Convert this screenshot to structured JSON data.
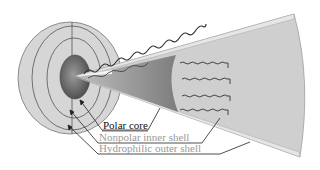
{
  "figure": {
    "type": "micelle-cross-section",
    "labels": {
      "polar_core": "Polar core",
      "nonpolar_inner_shell": "Nonpolar inner shell",
      "hydrophilic_outer_shell": "Hydrophilic outer shell"
    },
    "colors": {
      "background": "#ffffff",
      "sphere_fill": "#d4d4d4",
      "sphere_stroke": "#6f6f6f",
      "core_fill": "#6b6b6b",
      "cone_fill": "#cfcfcf",
      "cone_band": "#e2e2e2",
      "inner_wedge": "#8a8a8a",
      "chain_stroke": "#2e2e2e",
      "label_dark": "#111111",
      "label_light": "#9a9a9a"
    }
  }
}
